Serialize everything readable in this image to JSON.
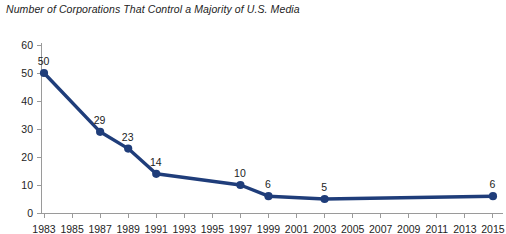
{
  "chart_data": {
    "type": "line",
    "title": "Number of Corporations That Control a Majority of U.S. Media",
    "xlabel": "",
    "ylabel": "",
    "ylim": [
      0,
      60
    ],
    "yticks": [
      0,
      10,
      20,
      30,
      40,
      50,
      60
    ],
    "xlim": [
      1983,
      2015
    ],
    "xticks": [
      1983,
      1985,
      1987,
      1989,
      1991,
      1993,
      1995,
      1997,
      1999,
      2001,
      2003,
      2005,
      2007,
      2009,
      2011,
      2013,
      2015
    ],
    "xtick_labels": [
      "1983",
      "1985",
      "1987",
      "1989",
      "1991",
      "1993",
      "1995",
      "1997",
      "1999",
      "2001",
      "2003",
      "2005",
      "2007",
      "2009",
      "2011",
      "2013",
      "2015"
    ],
    "grid": false,
    "legend": "none",
    "series": [
      {
        "name": "Corporations controlling a majority of U.S. media",
        "color": "#1f3d7a",
        "marker": "circle",
        "x": [
          1983,
          1987,
          1989,
          1991,
          1997,
          1999,
          2003,
          2015
        ],
        "values": [
          50,
          29,
          23,
          14,
          10,
          6,
          5,
          6
        ],
        "point_labels": [
          "50",
          "29",
          "23",
          "14",
          "10",
          "6",
          "5",
          "6"
        ]
      }
    ]
  },
  "colors": {
    "series": "#1f3d7a",
    "axis": "#9a9a9a",
    "text": "#242424",
    "background": "#ffffff"
  }
}
